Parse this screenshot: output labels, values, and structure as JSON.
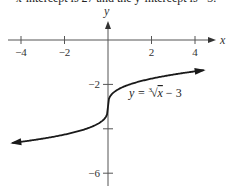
{
  "caption": "x-intercept is 27 and the y-intercept is −3.",
  "chart_data": {
    "type": "line",
    "title": "",
    "xlabel": "x",
    "ylabel": "y",
    "equation": "y = ∛x − 3",
    "equation_parts": {
      "lhs": "y = ",
      "index": "3",
      "radical": "√",
      "radicand": "x",
      "rest": " − 3"
    },
    "xlim": [
      -4.4,
      4.4
    ],
    "ylim": [
      -6.5,
      1
    ],
    "x_ticks": [
      -4,
      -2,
      2,
      4
    ],
    "x_tick_labels": [
      "−4",
      "−2",
      "2",
      "4"
    ],
    "y_ticks": [
      -2,
      -4,
      -6
    ],
    "y_tick_labels": [
      "−2",
      "",
      "−6"
    ],
    "grid": false,
    "series": [
      {
        "name": "y = cbrt(x) - 3",
        "x": [
          -4.4,
          -3,
          -2,
          -1,
          -0.5,
          -0.1,
          0,
          0.1,
          0.5,
          1,
          2,
          3,
          4.4
        ],
        "values": [
          -4.64,
          -4.44,
          -4.26,
          -4.0,
          -3.79,
          -3.46,
          -3.0,
          -2.54,
          -2.21,
          -2.0,
          -1.74,
          -1.56,
          -1.36
        ]
      }
    ],
    "colors": {
      "curve": "#1a1a1a",
      "axis": "#555555"
    }
  }
}
